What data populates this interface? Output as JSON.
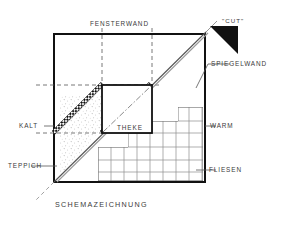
{
  "drawing": {
    "title": "SCHEMAZEICHNUNG",
    "type": "architectural-schematic",
    "background_color": "#ffffff",
    "ink_color": "#1a1a1a",
    "text_color": "#3a3a3a"
  },
  "labels": {
    "top_wall": "FENSTERWAND",
    "right_wall": "SPIEGELWAND",
    "left_zone": "KALT",
    "right_zone": "WARM",
    "floor_left": "TEPPICH",
    "floor_right": "FLIESEN",
    "center_object": "THEKE",
    "cut_marker": "\"CUT\"",
    "caption": "SCHEMAZEICHNUNG"
  },
  "annotations": {
    "cut_arrow": "black-triangle-pointing-down-left",
    "diagonal_bands": 2,
    "tile_grid_name": "FLIESEN",
    "carpet_texture_name": "TEPPICH"
  },
  "geometry": {
    "frame": {
      "x": 53,
      "y": 33,
      "width": 152,
      "height": 150
    },
    "counter": {
      "x": 102,
      "y": 85,
      "width": 50,
      "height": 48
    }
  }
}
